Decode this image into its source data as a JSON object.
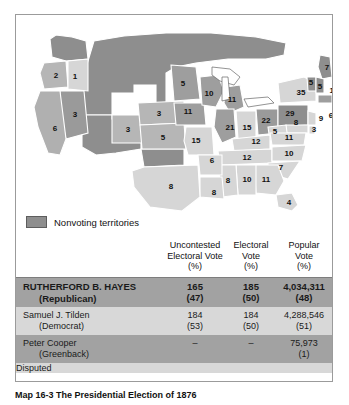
{
  "figure": {
    "legend": {
      "swatch_color": "#8e8e8e",
      "label": "Nonvoting territories"
    },
    "caption": "Map 16-3  The Presidential Election of 1876"
  },
  "map": {
    "title": "Presidential Election of 1876 electoral vote map",
    "state_votes": [
      {
        "state": "Oregon",
        "abbr": "OR",
        "votes": "2",
        "x": 40,
        "y": 61,
        "party": "republican"
      },
      {
        "state": "Idaho Territory",
        "abbr": "ID",
        "votes": "1",
        "x": 59,
        "y": 62,
        "party": "territory-light"
      },
      {
        "state": "Nevada",
        "abbr": "NV",
        "votes": "3",
        "x": 59,
        "y": 100,
        "party": "republican"
      },
      {
        "state": "California",
        "abbr": "CA",
        "votes": "6",
        "x": 39,
        "y": 114,
        "party": "republican"
      },
      {
        "state": "Colorado",
        "abbr": "CO",
        "votes": "3",
        "x": 112,
        "y": 115,
        "party": "republican"
      },
      {
        "state": "Nebraska",
        "abbr": "NE",
        "votes": "3",
        "x": 143,
        "y": 99,
        "party": "republican"
      },
      {
        "state": "Kansas",
        "abbr": "KS",
        "votes": "5",
        "x": 147,
        "y": 123,
        "party": "republican"
      },
      {
        "state": "Minnesota",
        "abbr": "MN",
        "votes": "5",
        "x": 167,
        "y": 69,
        "party": "republican"
      },
      {
        "state": "Iowa",
        "abbr": "IA",
        "votes": "11",
        "x": 172,
        "y": 97,
        "party": "republican"
      },
      {
        "state": "Missouri",
        "abbr": "MO",
        "votes": "15",
        "x": 180,
        "y": 126,
        "party": "democrat"
      },
      {
        "state": "Wisconsin",
        "abbr": "WI",
        "votes": "10",
        "x": 193,
        "y": 79,
        "party": "republican"
      },
      {
        "state": "Michigan",
        "abbr": "MI",
        "votes": "11",
        "x": 216,
        "y": 85,
        "party": "republican"
      },
      {
        "state": "Illinois",
        "abbr": "IL",
        "votes": "21",
        "x": 214,
        "y": 113,
        "party": "republican"
      },
      {
        "state": "Indiana",
        "abbr": "IN",
        "votes": "15",
        "x": 231,
        "y": 113,
        "party": "democrat"
      },
      {
        "state": "Ohio",
        "abbr": "OH",
        "votes": "22",
        "x": 250,
        "y": 106,
        "party": "republican"
      },
      {
        "state": "Pennsylvania",
        "abbr": "PA",
        "votes": "29",
        "x": 274,
        "y": 99,
        "party": "republican"
      },
      {
        "state": "New York",
        "abbr": "NY",
        "votes": "35",
        "x": 285,
        "y": 78,
        "party": "democrat"
      },
      {
        "state": "Maine",
        "abbr": "ME",
        "votes": "7",
        "x": 311,
        "y": 53,
        "party": "republican"
      },
      {
        "state": "Vermont",
        "abbr": "VT",
        "votes": "5",
        "x": 295,
        "y": 68,
        "party": "republican"
      },
      {
        "state": "New Hampshire",
        "abbr": "NH",
        "votes": "5",
        "x": 304,
        "y": 72,
        "party": "republican"
      },
      {
        "state": "Massachusetts",
        "abbr": "MA",
        "votes": "13",
        "x": 318,
        "y": 76,
        "party": "republican"
      },
      {
        "state": "Rhode Island",
        "abbr": "RI",
        "votes": "4",
        "x": 320,
        "y": 92,
        "party": "republican"
      },
      {
        "state": "Connecticut",
        "abbr": "CT",
        "votes": "6",
        "x": 315,
        "y": 101,
        "party": "democrat"
      },
      {
        "state": "New Jersey",
        "abbr": "NJ",
        "votes": "9",
        "x": 305,
        "y": 104,
        "party": "democrat"
      },
      {
        "state": "Delaware",
        "abbr": "DE",
        "votes": "3",
        "x": 298,
        "y": 115,
        "party": "democrat"
      },
      {
        "state": "Maryland",
        "abbr": "MD",
        "votes": "8",
        "x": 280,
        "y": 108,
        "party": "democrat"
      },
      {
        "state": "West Virginia",
        "abbr": "WV",
        "votes": "5",
        "x": 259,
        "y": 117,
        "party": "democrat"
      },
      {
        "state": "Virginia",
        "abbr": "VA",
        "votes": "11",
        "x": 273,
        "y": 123,
        "party": "democrat"
      },
      {
        "state": "Kentucky",
        "abbr": "KY",
        "votes": "12",
        "x": 240,
        "y": 127,
        "party": "democrat"
      },
      {
        "state": "Tennessee",
        "abbr": "TN",
        "votes": "12",
        "x": 231,
        "y": 143,
        "party": "democrat"
      },
      {
        "state": "North Carolina",
        "abbr": "NC",
        "votes": "10",
        "x": 273,
        "y": 139,
        "party": "democrat"
      },
      {
        "state": "South Carolina",
        "abbr": "SC",
        "votes": "7",
        "x": 265,
        "y": 153,
        "party": "democrat"
      },
      {
        "state": "Georgia",
        "abbr": "GA",
        "votes": "11",
        "x": 250,
        "y": 165,
        "party": "democrat"
      },
      {
        "state": "Alabama",
        "abbr": "AL",
        "votes": "10",
        "x": 231,
        "y": 165,
        "party": "democrat"
      },
      {
        "state": "Mississippi",
        "abbr": "MS",
        "votes": "8",
        "x": 212,
        "y": 166,
        "party": "democrat"
      },
      {
        "state": "Arkansas",
        "abbr": "AR",
        "votes": "6",
        "x": 196,
        "y": 146,
        "party": "democrat"
      },
      {
        "state": "Louisiana",
        "abbr": "LA",
        "votes": "8",
        "x": 198,
        "y": 178,
        "party": "democrat"
      },
      {
        "state": "Texas",
        "abbr": "TX",
        "votes": "8",
        "x": 155,
        "y": 172,
        "party": "democrat"
      },
      {
        "state": "Florida",
        "abbr": "FL",
        "votes": "4",
        "x": 273,
        "y": 188,
        "party": "democrat"
      }
    ]
  },
  "table": {
    "columns": [
      {
        "key": "candidate",
        "header_lines": [
          "",
          "",
          ""
        ]
      },
      {
        "key": "uncontested",
        "header_lines": [
          "Uncontested",
          "Electoral Vote",
          "(%)"
        ]
      },
      {
        "key": "electoral",
        "header_lines": [
          "Electoral",
          "Vote",
          "(%)"
        ]
      },
      {
        "key": "popular",
        "header_lines": [
          "Popular",
          "Vote",
          "(%)"
        ]
      }
    ],
    "rows": [
      {
        "name": "RUTHERFORD B. HAYES",
        "party": "(Republican)",
        "winner": true,
        "uncontested": "165",
        "uncontested_pct": "(47)",
        "electoral": "185",
        "electoral_pct": "(50)",
        "popular": "4,034,311",
        "popular_pct": "(48)"
      },
      {
        "name": "Samuel J. Tilden",
        "party": "(Democrat)",
        "winner": false,
        "uncontested": "184",
        "uncontested_pct": "(53)",
        "electoral": "184",
        "electoral_pct": "(50)",
        "popular": "4,288,546",
        "popular_pct": "(51)"
      },
      {
        "name": "Peter Cooper",
        "party": "(Greenback)",
        "winner": false,
        "uncontested": "–",
        "uncontested_pct": "",
        "electoral": "–",
        "electoral_pct": "",
        "popular": "75,973",
        "popular_pct": "(1)"
      }
    ],
    "footer_row": "Disputed"
  },
  "colors": {
    "republican": "#8e8e8e",
    "democrat": "#d0d0d0",
    "territory": "#8e8e8e",
    "row_dark": "#a2a2a2",
    "row_light": "#d8d8d8",
    "border": "#7d7d7d"
  }
}
